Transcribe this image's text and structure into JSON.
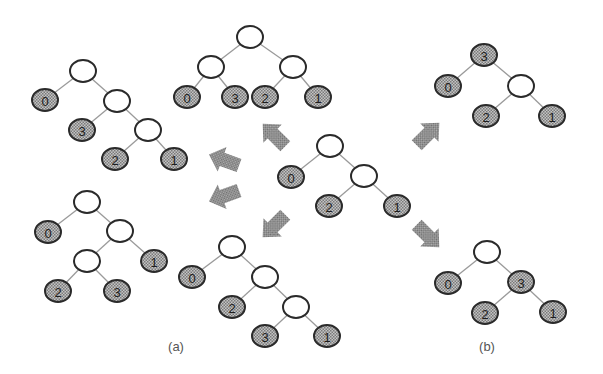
{
  "figure": {
    "width": 603,
    "height": 374,
    "colors": {
      "background": "#ffffff",
      "leaf_fill": "#a9a9a9",
      "node_stroke": "#2a2a2a",
      "edge": "#9a9a9a",
      "arrow": "#8c8c8c"
    },
    "captions": [
      {
        "id": "a",
        "label": "(a)",
        "x": 176,
        "y": 351
      },
      {
        "id": "b",
        "label": "(b)",
        "x": 487,
        "y": 351
      }
    ],
    "trees": [
      {
        "id": "center",
        "nodes": [
          {
            "id": "r",
            "x": 330,
            "y": 146,
            "label": ""
          },
          {
            "id": "l0",
            "x": 291,
            "y": 177,
            "label": "0"
          },
          {
            "id": "i1",
            "x": 364,
            "y": 176,
            "label": ""
          },
          {
            "id": "l2",
            "x": 329,
            "y": 206,
            "label": "2"
          },
          {
            "id": "l1",
            "x": 397,
            "y": 206,
            "label": "1"
          }
        ],
        "edges": [
          [
            "r",
            "l0"
          ],
          [
            "r",
            "i1"
          ],
          [
            "i1",
            "l2"
          ],
          [
            "i1",
            "l1"
          ]
        ]
      },
      {
        "id": "a-top-left",
        "nodes": [
          {
            "id": "r",
            "x": 83,
            "y": 71,
            "label": ""
          },
          {
            "id": "l0",
            "x": 45,
            "y": 100,
            "label": "0"
          },
          {
            "id": "i1",
            "x": 117,
            "y": 101,
            "label": ""
          },
          {
            "id": "l3",
            "x": 82,
            "y": 130,
            "label": "3"
          },
          {
            "id": "i2",
            "x": 148,
            "y": 130,
            "label": ""
          },
          {
            "id": "l2",
            "x": 115,
            "y": 159,
            "label": "2"
          },
          {
            "id": "l1",
            "x": 174,
            "y": 159,
            "label": "1"
          }
        ],
        "edges": [
          [
            "r",
            "l0"
          ],
          [
            "r",
            "i1"
          ],
          [
            "i1",
            "l3"
          ],
          [
            "i1",
            "i2"
          ],
          [
            "i2",
            "l2"
          ],
          [
            "i2",
            "l1"
          ]
        ]
      },
      {
        "id": "a-top-center",
        "nodes": [
          {
            "id": "r",
            "x": 250,
            "y": 37,
            "label": ""
          },
          {
            "id": "i1",
            "x": 211,
            "y": 67,
            "label": ""
          },
          {
            "id": "i2",
            "x": 293,
            "y": 67,
            "label": ""
          },
          {
            "id": "l0",
            "x": 187,
            "y": 97,
            "label": "0"
          },
          {
            "id": "l3",
            "x": 235,
            "y": 97,
            "label": "3"
          },
          {
            "id": "l2",
            "x": 265,
            "y": 97,
            "label": "2"
          },
          {
            "id": "l1",
            "x": 318,
            "y": 97,
            "label": "1"
          }
        ],
        "edges": [
          [
            "r",
            "i1"
          ],
          [
            "r",
            "i2"
          ],
          [
            "i1",
            "l0"
          ],
          [
            "i1",
            "l3"
          ],
          [
            "i2",
            "l2"
          ],
          [
            "i2",
            "l1"
          ]
        ]
      },
      {
        "id": "a-bottom-left",
        "nodes": [
          {
            "id": "r",
            "x": 87,
            "y": 202,
            "label": ""
          },
          {
            "id": "l0",
            "x": 48,
            "y": 232,
            "label": "0"
          },
          {
            "id": "i1",
            "x": 120,
            "y": 231,
            "label": ""
          },
          {
            "id": "i2",
            "x": 87,
            "y": 261,
            "label": ""
          },
          {
            "id": "l1",
            "x": 154,
            "y": 261,
            "label": "1"
          },
          {
            "id": "l2",
            "x": 58,
            "y": 291,
            "label": "2"
          },
          {
            "id": "l3",
            "x": 117,
            "y": 291,
            "label": "3"
          }
        ],
        "edges": [
          [
            "r",
            "l0"
          ],
          [
            "r",
            "i1"
          ],
          [
            "i1",
            "i2"
          ],
          [
            "i1",
            "l1"
          ],
          [
            "i2",
            "l2"
          ],
          [
            "i2",
            "l3"
          ]
        ]
      },
      {
        "id": "a-bottom-center",
        "nodes": [
          {
            "id": "r",
            "x": 232,
            "y": 247,
            "label": ""
          },
          {
            "id": "l0",
            "x": 192,
            "y": 277,
            "label": "0"
          },
          {
            "id": "i1",
            "x": 265,
            "y": 277,
            "label": ""
          },
          {
            "id": "l2",
            "x": 232,
            "y": 307,
            "label": "2"
          },
          {
            "id": "i2",
            "x": 296,
            "y": 307,
            "label": ""
          },
          {
            "id": "l3",
            "x": 265,
            "y": 336,
            "label": "3"
          },
          {
            "id": "l1",
            "x": 327,
            "y": 336,
            "label": "1"
          }
        ],
        "edges": [
          [
            "r",
            "l0"
          ],
          [
            "r",
            "i1"
          ],
          [
            "i1",
            "l2"
          ],
          [
            "i1",
            "i2"
          ],
          [
            "i2",
            "l3"
          ],
          [
            "i2",
            "l1"
          ]
        ]
      },
      {
        "id": "b-top-right",
        "nodes": [
          {
            "id": "l3",
            "x": 484,
            "y": 55,
            "label": "3"
          },
          {
            "id": "l0",
            "x": 448,
            "y": 86,
            "label": "0"
          },
          {
            "id": "i1",
            "x": 521,
            "y": 86,
            "label": ""
          },
          {
            "id": "l2",
            "x": 486,
            "y": 116,
            "label": "2"
          },
          {
            "id": "l1",
            "x": 552,
            "y": 116,
            "label": "1"
          }
        ],
        "edges": [
          [
            "l3",
            "l0"
          ],
          [
            "l3",
            "i1"
          ],
          [
            "i1",
            "l2"
          ],
          [
            "i1",
            "l1"
          ]
        ]
      },
      {
        "id": "b-bottom-right",
        "nodes": [
          {
            "id": "r",
            "x": 487,
            "y": 252,
            "label": ""
          },
          {
            "id": "l0",
            "x": 448,
            "y": 283,
            "label": "0"
          },
          {
            "id": "l3",
            "x": 521,
            "y": 282,
            "label": "3"
          },
          {
            "id": "l2",
            "x": 485,
            "y": 313,
            "label": "2"
          },
          {
            "id": "l1",
            "x": 553,
            "y": 312,
            "label": "1"
          }
        ],
        "edges": [
          [
            "r",
            "l0"
          ],
          [
            "r",
            "l3"
          ],
          [
            "l3",
            "l2"
          ],
          [
            "l3",
            "l1"
          ]
        ]
      }
    ],
    "arrows": [
      {
        "id": "to-top-center",
        "cx": 274,
        "cy": 135,
        "angle": -135
      },
      {
        "id": "to-top-left",
        "cx": 224,
        "cy": 160,
        "angle": -160
      },
      {
        "id": "to-bottom-left",
        "cx": 224,
        "cy": 196,
        "angle": 160
      },
      {
        "id": "to-bottom-center",
        "cx": 274,
        "cy": 226,
        "angle": 135
      },
      {
        "id": "to-top-right",
        "cx": 428,
        "cy": 134,
        "angle": -45
      },
      {
        "id": "to-bottom-right",
        "cx": 428,
        "cy": 236,
        "angle": 45
      }
    ]
  }
}
